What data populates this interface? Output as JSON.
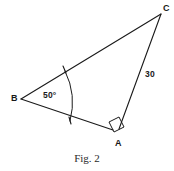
{
  "figure": {
    "caption": "Fig. 2",
    "background_color": "#ffffff",
    "stroke_color": "#1a1a1a",
    "text_color": "#181818"
  },
  "diagram": {
    "type": "geometry-triangle",
    "shape_name": "triangle-ABC",
    "vertices": [
      {
        "id": "B",
        "label": "B",
        "x": 21,
        "y": 99
      },
      {
        "id": "C",
        "label": "C",
        "x": 161,
        "y": 14
      },
      {
        "id": "A",
        "label": "A",
        "x": 117,
        "y": 134
      }
    ],
    "sides": [
      {
        "id": "BC",
        "from": "B",
        "to": "C",
        "label": ""
      },
      {
        "id": "CA",
        "from": "C",
        "to": "A",
        "label": "30"
      },
      {
        "id": "AB",
        "from": "A",
        "to": "B",
        "label": ""
      }
    ],
    "angles": [
      {
        "at": "B",
        "label": "50°",
        "value": 50,
        "marker": "arc"
      },
      {
        "at": "A",
        "label": "",
        "value": 90,
        "marker": "right-angle-square"
      }
    ]
  },
  "labels": {
    "vertex_a": "A",
    "vertex_b": "B",
    "vertex_c": "C",
    "angle_b": "50°",
    "side_ac": "30"
  }
}
